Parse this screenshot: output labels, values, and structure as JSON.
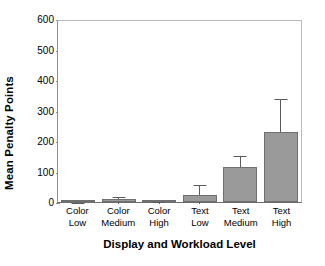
{
  "chart_data": {
    "type": "bar",
    "title": "",
    "xlabel": "Display and Workload Level",
    "ylabel": "Mean Penalty Points",
    "categories": [
      "Color Low",
      "Color Medium",
      "Color High",
      "Text Low",
      "Text Medium",
      "Text High"
    ],
    "category_lines": [
      [
        "Color",
        "Low"
      ],
      [
        "Color",
        "Medium"
      ],
      [
        "Color",
        "High"
      ],
      [
        "Text",
        "Low"
      ],
      [
        "Text",
        "Medium"
      ],
      [
        "Text",
        "High"
      ]
    ],
    "values": [
      2,
      10,
      3,
      23,
      115,
      228
    ],
    "error_upper": [
      4,
      22,
      5,
      62,
      157,
      343
    ],
    "error_lower": [
      0,
      0,
      0,
      0,
      73,
      145
    ],
    "ylim": [
      0,
      600
    ],
    "yticks": [
      0,
      100,
      200,
      300,
      400,
      500,
      600
    ],
    "ytick_labels": [
      "0",
      "100",
      "200",
      "300",
      "400",
      "500",
      "600"
    ],
    "grid": false,
    "legend": false,
    "legend_position": "none",
    "bar_color": "#9a9a9a",
    "bar_edge_color": "#6f6f6f",
    "error_color": "#5b5b5b",
    "axis_color": "#6d6d6d",
    "background": "#ffffff"
  }
}
